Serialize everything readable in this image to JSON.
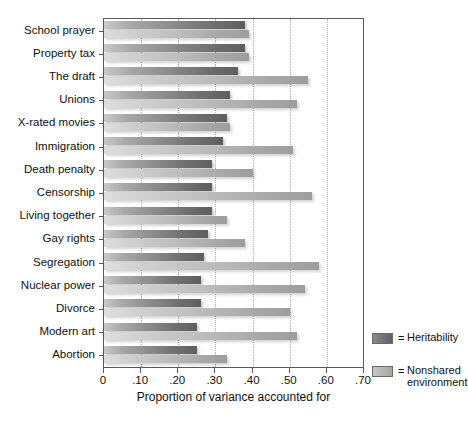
{
  "chart_data": {
    "type": "bar",
    "orientation": "horizontal",
    "title": "",
    "xlabel": "Proportion of variance accounted for",
    "ylabel": "",
    "xlim": [
      0,
      0.7
    ],
    "xticks": [
      "0",
      ".10",
      ".20",
      ".30",
      ".40",
      ".50",
      ".60",
      ".70"
    ],
    "xtick_values": [
      0,
      0.1,
      0.2,
      0.3,
      0.4,
      0.5,
      0.6,
      0.7
    ],
    "grid": "vertical-dotted",
    "legend_position": "right-bottom",
    "categories": [
      "School prayer",
      "Property tax",
      "The draft",
      "Unions",
      "X-rated movies",
      "Immigration",
      "Death penalty",
      "Censorship",
      "Living together",
      "Gay rights",
      "Segregation",
      "Nuclear power",
      "Divorce",
      "Modern art",
      "Abortion"
    ],
    "series": [
      {
        "name": "Heritability",
        "color": "#6e6e6e",
        "values": [
          0.38,
          0.38,
          0.36,
          0.34,
          0.33,
          0.32,
          0.29,
          0.29,
          0.29,
          0.28,
          0.27,
          0.26,
          0.26,
          0.25,
          0.25
        ]
      },
      {
        "name": "Nonshared environment",
        "color": "#b4b4b4",
        "values": [
          0.39,
          0.39,
          0.55,
          0.52,
          0.34,
          0.51,
          0.4,
          0.56,
          0.33,
          0.38,
          0.58,
          0.54,
          0.5,
          0.52,
          0.33
        ]
      }
    ]
  },
  "legend": {
    "equals": "=",
    "items": [
      {
        "label": "Heritability",
        "swatch": "dark"
      },
      {
        "label": "Nonshared\nenvironment",
        "swatch": "light"
      }
    ],
    "item0_label": "Heritability",
    "item1_line1": "Nonshared",
    "item1_line2": "environment"
  }
}
